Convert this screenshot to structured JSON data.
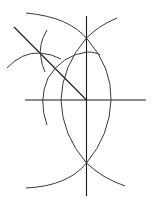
{
  "diagram": {
    "type": "geometric-construction",
    "stroke_color": "#1a1a1a",
    "background": "#ffffff",
    "labels": []
  }
}
